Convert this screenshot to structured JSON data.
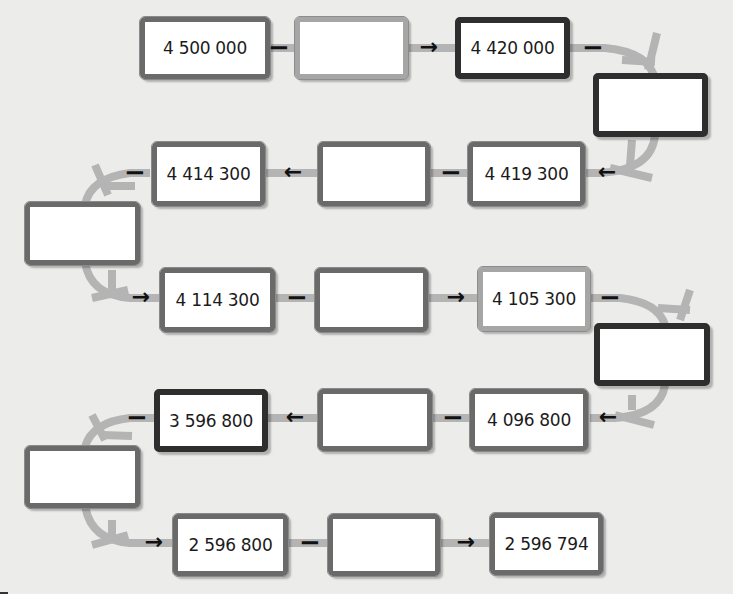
{
  "diagram": {
    "title": "",
    "type": "subtraction-chain",
    "colors": {
      "background": "#ececea",
      "connector": "#b4b4b4",
      "box_fill": "#ffffff",
      "box_border_mid": "#6a6a6a",
      "box_border_dark": "#2e2e2e",
      "box_border_light": "#a6a6a6",
      "operator": "#111111"
    },
    "operators": {
      "minus": "−",
      "arrow_right": "→",
      "arrow_left": "←"
    },
    "boxes": [
      {
        "id": "b1",
        "value": "4 500 000",
        "filled": true
      },
      {
        "id": "b2",
        "value": "",
        "filled": false
      },
      {
        "id": "b3",
        "value": "4 420 000",
        "filled": true
      },
      {
        "id": "b4",
        "value": "",
        "filled": false
      },
      {
        "id": "b5",
        "value": "4 419 300",
        "filled": true
      },
      {
        "id": "b6",
        "value": "",
        "filled": false
      },
      {
        "id": "b7",
        "value": "4 414 300",
        "filled": true
      },
      {
        "id": "b8",
        "value": "",
        "filled": false
      },
      {
        "id": "b9",
        "value": "4 114 300",
        "filled": true
      },
      {
        "id": "b10",
        "value": "",
        "filled": false
      },
      {
        "id": "b11",
        "value": "4 105 300",
        "filled": true
      },
      {
        "id": "b12",
        "value": "",
        "filled": false
      },
      {
        "id": "b13",
        "value": "4 096 800",
        "filled": true
      },
      {
        "id": "b14",
        "value": "",
        "filled": false
      },
      {
        "id": "b15",
        "value": "3 596 800",
        "filled": true
      },
      {
        "id": "b16",
        "value": "",
        "filled": false
      },
      {
        "id": "b17",
        "value": "2 596 800",
        "filled": true
      },
      {
        "id": "b18",
        "value": "",
        "filled": false
      },
      {
        "id": "b19",
        "value": "2 596 794",
        "filled": true
      }
    ]
  }
}
